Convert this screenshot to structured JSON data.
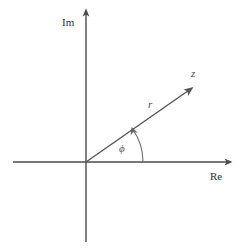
{
  "figure": {
    "background_color": "#ffffff",
    "width": 245,
    "height": 249
  },
  "colors": {
    "axis": "#4a4a4a",
    "vector": "#555555",
    "arc": "#6b6b6b",
    "text": "#2e2e2e",
    "math_text": "#4a4a4a"
  },
  "axes": {
    "origin": {
      "x": 86,
      "y": 162
    },
    "imaginary": {
      "label": "Im",
      "label_x": 62,
      "label_y": 26,
      "x": 86,
      "y_top": 10,
      "y_bottom": 242,
      "arrow": "up"
    },
    "real": {
      "label": "Re",
      "label_x": 210,
      "label_y": 180,
      "y": 162,
      "x_left": 13,
      "x_right": 231,
      "arrow": "right"
    }
  },
  "vector": {
    "label": "z",
    "label_x": 191,
    "label_y": 77,
    "tip_x": 192,
    "tip_y": 88,
    "magnitude_label": "r",
    "magnitude_label_x": 148,
    "magnitude_label_y": 108,
    "arrow": "tip"
  },
  "angle": {
    "label": "ϕ",
    "label_x": 119,
    "label_y": 152,
    "arc_radius": 57,
    "arc_start_deg": 0,
    "arc_end_deg": 35,
    "arrow": "counterclockwise"
  },
  "icons": {
    "up-arrow-icon": "↑",
    "right-arrow-icon": "→",
    "vector-arrow-icon": "↗",
    "arc-arrow-icon": "↶"
  }
}
